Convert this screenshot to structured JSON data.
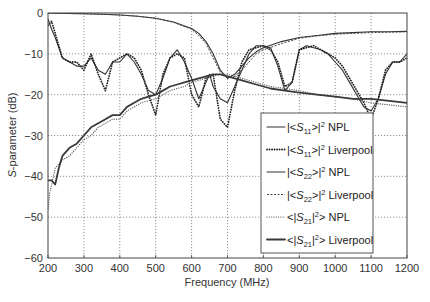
{
  "chart_data": {
    "type": "line",
    "title": "",
    "xlabel": "Frequency (MHz)",
    "ylabel_italic": "S",
    "ylabel_rest": "-parameter (dB)",
    "xlim": [
      200,
      1200
    ],
    "ylim": [
      -60,
      0
    ],
    "grid": true,
    "legend_position": "lower right (inside)",
    "xticks": [
      200,
      300,
      400,
      500,
      600,
      700,
      800,
      900,
      1000,
      1100,
      1200
    ],
    "yticks": [
      0,
      -10,
      -20,
      -30,
      -40,
      -50,
      -60
    ],
    "xtick_labels": [
      "200",
      "300",
      "400",
      "500",
      "600",
      "700",
      "800",
      "900",
      "1000",
      "1100",
      "1200"
    ],
    "ytick_labels": [
      "0",
      "−10",
      "−20",
      "−30",
      "−40",
      "−50",
      "−60"
    ],
    "series": [
      {
        "name": "|<S11>|^2 NPL",
        "legend": {
          "pre": "|<",
          "sym": "S",
          "sub": "11",
          "post": ">|",
          "sup": "2",
          "tail": " NPL"
        },
        "style": "solid",
        "color": "#333333",
        "width": 1.1,
        "x": [
          200,
          210,
          220,
          240,
          260,
          280,
          300,
          320,
          340,
          360,
          380,
          400,
          420,
          440,
          460,
          480,
          500,
          520,
          540,
          560,
          580,
          600,
          620,
          640,
          650,
          660,
          680,
          700,
          720,
          740,
          760,
          780,
          800,
          820,
          840,
          860,
          880,
          900,
          920,
          940,
          960,
          980,
          1000,
          1020,
          1040,
          1060,
          1080,
          1100,
          1120,
          1140,
          1160,
          1180,
          1200
        ],
        "y": [
          -1.5,
          -4,
          -6,
          -11,
          -12,
          -13,
          -13,
          -11,
          -14,
          -15,
          -12,
          -12,
          -10,
          -12,
          -15,
          -19,
          -20,
          -16,
          -11,
          -9,
          -12,
          -16,
          -21,
          -17,
          -15,
          -18,
          -21,
          -22,
          -18,
          -14,
          -10,
          -8,
          -8,
          -8.5,
          -13,
          -19,
          -17,
          -9,
          -8,
          -8.5,
          -9,
          -10,
          -12,
          -14,
          -17,
          -20,
          -23,
          -24,
          -21,
          -15,
          -12,
          -12,
          -10
        ]
      },
      {
        "name": "|<S11>|^2 Liverpool",
        "legend": {
          "pre": "|<",
          "sym": "S",
          "sub": "11",
          "post": ">|",
          "sup": "2",
          "tail": " Liverpool"
        },
        "style": "dotted-heavy",
        "color": "#222222",
        "width": 1.8,
        "x": [
          200,
          210,
          220,
          240,
          260,
          280,
          300,
          320,
          340,
          360,
          380,
          400,
          420,
          440,
          460,
          480,
          500,
          520,
          540,
          560,
          580,
          600,
          620,
          640,
          660,
          680,
          700,
          720,
          740,
          760,
          780,
          800,
          820,
          840,
          860,
          880,
          900,
          920,
          940,
          960,
          980,
          1000,
          1020,
          1040,
          1060,
          1080,
          1100,
          1120,
          1140,
          1160,
          1180,
          1200
        ],
        "y": [
          -3,
          -2,
          -5,
          -11,
          -12,
          -12,
          -14,
          -10,
          -15,
          -19,
          -12,
          -11,
          -10,
          -11,
          -14,
          -20,
          -25,
          -15,
          -11,
          -10,
          -11,
          -20,
          -23,
          -16,
          -15,
          -26,
          -28,
          -19,
          -12,
          -9,
          -8.5,
          -8,
          -9,
          -12,
          -18,
          -17,
          -9,
          -8.5,
          -8,
          -9,
          -10,
          -11,
          -13,
          -16,
          -19,
          -22,
          -26,
          -21,
          -14,
          -12,
          -12,
          -11
        ]
      },
      {
        "name": "|<S22>|^2 NPL",
        "legend": {
          "pre": "|<",
          "sym": "S",
          "sub": "22",
          "post": ">|",
          "sup": "2",
          "tail": " NPL"
        },
        "style": "solid",
        "color": "#333333",
        "width": 1.1,
        "x": [
          200,
          250,
          300,
          350,
          400,
          450,
          500,
          550,
          600,
          620,
          640,
          660,
          680,
          700,
          720,
          740,
          760,
          780,
          800,
          850,
          900,
          950,
          1000,
          1050,
          1100,
          1150,
          1200
        ],
        "y": [
          0,
          -0.1,
          -0.2,
          -0.3,
          -0.5,
          -0.8,
          -1.3,
          -2.2,
          -3.8,
          -5,
          -7,
          -10,
          -14,
          -16,
          -15,
          -13,
          -11,
          -9.5,
          -8.5,
          -7,
          -6,
          -5.5,
          -5,
          -4.8,
          -4.6,
          -4.6,
          -4.5
        ]
      },
      {
        "name": "|<S22>|^2 Liverpool",
        "legend": {
          "pre": "|<",
          "sym": "S",
          "sub": "22",
          "post": ">|",
          "sup": "2",
          "tail": " Liverpool"
        },
        "style": "dashed-fine",
        "color": "#444444",
        "width": 1.0,
        "x": [
          200,
          250,
          300,
          350,
          400,
          450,
          500,
          550,
          600,
          620,
          640,
          660,
          680,
          700,
          720,
          740,
          760,
          780,
          800,
          850,
          900,
          950,
          1000,
          1050,
          1100,
          1150,
          1200
        ],
        "y": [
          0,
          -0.1,
          -0.2,
          -0.3,
          -0.5,
          -0.8,
          -1.3,
          -2.3,
          -4,
          -5.5,
          -7.5,
          -11,
          -14.5,
          -16,
          -15.5,
          -14,
          -12,
          -10,
          -9,
          -7.5,
          -6.2,
          -5.6,
          -5.2,
          -5,
          -4.8,
          -4.7,
          -4.6
        ]
      },
      {
        "name": "<|S21|^2> NPL",
        "legend": {
          "pre": "<|",
          "sym": "S",
          "sub": "21",
          "post": "|",
          "sup": "2",
          "tail": "> NPL"
        },
        "style": "dotted",
        "color": "#555555",
        "width": 1.2,
        "x": [
          200,
          205,
          210,
          220,
          240,
          260,
          280,
          300,
          320,
          340,
          360,
          380,
          400,
          420,
          440,
          460,
          480,
          500,
          520,
          540,
          560,
          580,
          600,
          620,
          640,
          660,
          680,
          700,
          740,
          780,
          820,
          860,
          900,
          950,
          1000,
          1050,
          1100,
          1150,
          1200
        ],
        "y": [
          -48,
          -44,
          -42,
          -38,
          -36,
          -35,
          -33,
          -31,
          -30,
          -28,
          -27,
          -26,
          -26,
          -24,
          -23,
          -22,
          -21.5,
          -21,
          -20,
          -19,
          -18.5,
          -18,
          -17,
          -16.5,
          -16,
          -15.5,
          -15,
          -15,
          -16,
          -17,
          -18,
          -18.5,
          -19,
          -20,
          -20.5,
          -21,
          -22,
          -22.5,
          -23
        ]
      },
      {
        "name": "<|S21|^2> Liverpool",
        "legend": {
          "pre": "<|",
          "sym": "S",
          "sub": "21",
          "post": "|",
          "sup": "2",
          "tail": "> Liverpool"
        },
        "style": "solid-heavy",
        "color": "#3a3a3a",
        "width": 1.8,
        "x": [
          200,
          205,
          210,
          220,
          230,
          240,
          260,
          280,
          300,
          320,
          340,
          360,
          380,
          400,
          420,
          440,
          460,
          480,
          500,
          520,
          540,
          560,
          580,
          600,
          620,
          640,
          660,
          680,
          700,
          740,
          780,
          820,
          860,
          900,
          950,
          1000,
          1050,
          1100,
          1150,
          1200
        ],
        "y": [
          -41,
          -41,
          -41,
          -42,
          -38,
          -35,
          -33,
          -32,
          -30,
          -28,
          -27,
          -26,
          -25,
          -25,
          -23,
          -22,
          -21,
          -20.5,
          -20,
          -19,
          -18,
          -17.5,
          -17,
          -16.5,
          -16,
          -15.5,
          -15,
          -15,
          -15.5,
          -16.5,
          -17.5,
          -18.5,
          -19,
          -19.5,
          -20,
          -20.5,
          -21,
          -21,
          -21.5,
          -22
        ]
      }
    ]
  }
}
